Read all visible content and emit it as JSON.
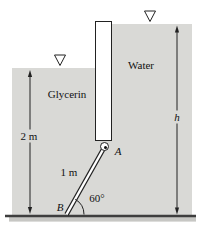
{
  "figure": {
    "fluids": {
      "left_label": "Glycerin",
      "right_label": "Water"
    },
    "dimensions": {
      "left_depth": "2 m",
      "right_depth": "h",
      "strut_length": "1 m",
      "strut_angle": "60°"
    },
    "points": {
      "hinge": "A",
      "base": "B"
    },
    "icons": {
      "left_surface": "free-surface-marker",
      "right_surface": "free-surface-marker"
    },
    "colors": {
      "fluid_fill": "#d9d9d6",
      "gate_fill": "#ffffff",
      "line": "#222222",
      "ground": "#3e3e3e",
      "ground_shadow": "#c7c7c4"
    }
  }
}
